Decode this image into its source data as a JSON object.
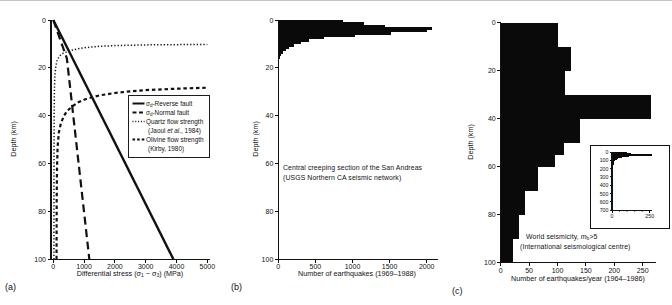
{
  "figure": {
    "bg": "#ffffff",
    "ink": "#111111",
    "bar_fill": "#0a0a0a"
  },
  "panels": {
    "a": {
      "tag": "(a)",
      "ylabel": "Depth (km)",
      "xlabel_parts": {
        "p1": "Differential stress (σ",
        "s1": "1",
        "p2": " − σ",
        "s2": "3",
        "p3": ") (MPa)"
      },
      "legend": [
        {
          "style": "solid",
          "sym": "σ",
          "sym_sub": "d",
          "text": "-Reverse fault",
          "line2": ""
        },
        {
          "style": "long-dash",
          "sym": "σ",
          "sym_sub": "d",
          "text": "-Normal fault",
          "line2": ""
        },
        {
          "style": "dotted",
          "sym": "",
          "sym_sub": "",
          "text": "Quartz flow strength",
          "line2": "(Jaoul *et al*., 1984)"
        },
        {
          "style": "short-dash",
          "sym": "",
          "sym_sub": "",
          "text": "Olivine flow strength",
          "line2": "(Kirby, 1980)"
        }
      ]
    },
    "b": {
      "tag": "(b)",
      "ylabel": "Depth (km)",
      "xlabel": "Number of earthquakes (1969–1988)",
      "annotation": {
        "line1": "Central creeping section of the San Andreas",
        "line2": "(USGS Northern CA seismic network)"
      }
    },
    "c": {
      "tag": "(c)",
      "ylabel": "Depth (km)",
      "xlabel": "Number of earthquakes/year (1964–1986)",
      "annotation": {
        "line1_pre": "World seismicity, ",
        "line1_var": "m",
        "line1_sub": "b",
        "line1_post": ">5",
        "line2": "(International seismological centre)"
      }
    }
  },
  "chart_data": [
    {
      "id": "a",
      "type": "line",
      "panel": "(a)",
      "xlabel": "Differential stress (σ1 − σ3) (MPa)",
      "ylabel": "Depth (km)",
      "xlim": [
        0,
        5000
      ],
      "ylim": [
        0,
        100
      ],
      "y_orientation": "depth-increasing-downward",
      "xticks": [
        0,
        1000,
        2000,
        3000,
        4000,
        5000
      ],
      "yticks": [
        0,
        20,
        40,
        60,
        80,
        100
      ],
      "grid": false,
      "legend_position": "center-right-box",
      "series": [
        {
          "name": "σd-Reverse fault",
          "style": "solid",
          "points": [
            [
              0,
              0
            ],
            [
              3900,
              100
            ]
          ]
        },
        {
          "name": "σd-Normal fault",
          "style": "long-dash",
          "points": [
            [
              0,
              0
            ],
            [
              440,
              16
            ],
            [
              1170,
              100
            ]
          ]
        },
        {
          "name": "Quartz flow strength (Jaoul et al., 1984)",
          "style": "dotted",
          "points": [
            [
              20,
              100
            ],
            [
              21,
              75
            ],
            [
              24,
              55
            ],
            [
              28,
              40
            ],
            [
              35,
              30
            ],
            [
              50,
              23.5
            ],
            [
              80,
              19.5
            ],
            [
              120,
              17
            ],
            [
              200,
              15
            ],
            [
              300,
              14
            ],
            [
              500,
              13
            ],
            [
              700,
              12.3
            ],
            [
              1000,
              11.6
            ],
            [
              1500,
              11
            ],
            [
              2000,
              10.7
            ],
            [
              3000,
              10.4
            ],
            [
              5000,
              10.2
            ]
          ]
        },
        {
          "name": "Olivine flow strength (Kirby, 1980)",
          "style": "short-dash",
          "points": [
            [
              105,
              100
            ],
            [
              110,
              75
            ],
            [
              120,
              62
            ],
            [
              140,
              53
            ],
            [
              180,
              47
            ],
            [
              250,
              43
            ],
            [
              350,
              40
            ],
            [
              450,
              38
            ],
            [
              600,
              36.3
            ],
            [
              800,
              34.5
            ],
            [
              1000,
              33.3
            ],
            [
              1200,
              32.5
            ],
            [
              1500,
              31.5
            ],
            [
              2000,
              30.5
            ],
            [
              2500,
              29.8
            ],
            [
              3000,
              29.3
            ],
            [
              4000,
              28.7
            ],
            [
              5000,
              28.3
            ]
          ]
        }
      ]
    },
    {
      "id": "b",
      "type": "bar",
      "orientation": "horizontal",
      "panel": "(b)",
      "xlabel": "Number of earthquakes (1969–1988)",
      "ylabel": "Depth (km)",
      "xlim": [
        0,
        2150
      ],
      "ylim": [
        0,
        100
      ],
      "xticks": [
        0,
        500,
        1000,
        1500,
        2000
      ],
      "yticks": [
        0,
        20,
        40,
        60,
        80,
        100
      ],
      "grid": false,
      "annotation": "Central creeping section of the San Andreas (USGS Northern CA seismic network)",
      "bars": [
        {
          "depth": [
            0,
            1
          ],
          "value": 870
        },
        {
          "depth": [
            1,
            2
          ],
          "value": 1150
        },
        {
          "depth": [
            2,
            3
          ],
          "value": 1440
        },
        {
          "depth": [
            3,
            4
          ],
          "value": 2070
        },
        {
          "depth": [
            4,
            5
          ],
          "value": 2000
        },
        {
          "depth": [
            5,
            6
          ],
          "value": 1520
        },
        {
          "depth": [
            6,
            7
          ],
          "value": 1030
        },
        {
          "depth": [
            7,
            8
          ],
          "value": 620
        },
        {
          "depth": [
            8,
            9
          ],
          "value": 410
        },
        {
          "depth": [
            9,
            10
          ],
          "value": 300
        },
        {
          "depth": [
            10,
            11
          ],
          "value": 210
        },
        {
          "depth": [
            11,
            12
          ],
          "value": 150
        },
        {
          "depth": [
            12,
            13
          ],
          "value": 100
        },
        {
          "depth": [
            13,
            14
          ],
          "value": 60
        },
        {
          "depth": [
            14,
            15
          ],
          "value": 35
        },
        {
          "depth": [
            15,
            16
          ],
          "value": 20
        },
        {
          "depth": [
            16,
            17
          ],
          "value": 10
        }
      ]
    },
    {
      "id": "c",
      "type": "bar",
      "orientation": "horizontal",
      "panel": "(c)",
      "xlabel": "Number of earthquakes/year (1964–1986)",
      "ylabel": "Depth (km)",
      "xlim": [
        0,
        275
      ],
      "ylim": [
        0,
        100
      ],
      "xticks": [
        0,
        50,
        100,
        150,
        200,
        250
      ],
      "yticks": [
        0,
        20,
        40,
        60,
        80,
        100
      ],
      "grid": false,
      "annotation": "World seismicity, mb>5 (International seismological centre)",
      "bars": [
        {
          "depth": [
            0,
            10
          ],
          "value": 100
        },
        {
          "depth": [
            10,
            20
          ],
          "value": 124
        },
        {
          "depth": [
            20,
            30
          ],
          "value": 114
        },
        {
          "depth": [
            30,
            40
          ],
          "value": 265
        },
        {
          "depth": [
            40,
            50
          ],
          "value": 140
        },
        {
          "depth": [
            50,
            55
          ],
          "value": 111
        },
        {
          "depth": [
            55,
            60
          ],
          "value": 96
        },
        {
          "depth": [
            60,
            70
          ],
          "value": 66
        },
        {
          "depth": [
            70,
            80
          ],
          "value": 42
        },
        {
          "depth": [
            80,
            90
          ],
          "value": 32
        },
        {
          "depth": [
            90,
            100
          ],
          "value": 22
        }
      ],
      "inset": {
        "type": "bar",
        "orientation": "horizontal",
        "xlim": [
          0,
          275
        ],
        "ylim": [
          0,
          700
        ],
        "xticks": [
          0,
          250
        ],
        "xticks_minor": [
          50,
          100,
          150,
          200
        ],
        "yticks": [
          0,
          100,
          200,
          300,
          400,
          500,
          600,
          700
        ],
        "bars": [
          {
            "depth": [
              0,
              10
            ],
            "value": 100
          },
          {
            "depth": [
              10,
              20
            ],
            "value": 124
          },
          {
            "depth": [
              20,
              30
            ],
            "value": 114
          },
          {
            "depth": [
              30,
              40
            ],
            "value": 265
          },
          {
            "depth": [
              40,
              50
            ],
            "value": 140
          },
          {
            "depth": [
              50,
              55
            ],
            "value": 111
          },
          {
            "depth": [
              55,
              60
            ],
            "value": 96
          },
          {
            "depth": [
              60,
              70
            ],
            "value": 66
          },
          {
            "depth": [
              70,
              80
            ],
            "value": 42
          },
          {
            "depth": [
              80,
              90
            ],
            "value": 32
          },
          {
            "depth": [
              90,
              100
            ],
            "value": 22
          },
          {
            "depth": [
              100,
              150
            ],
            "value": 14
          },
          {
            "depth": [
              150,
              200
            ],
            "value": 9
          },
          {
            "depth": [
              200,
              250
            ],
            "value": 6
          },
          {
            "depth": [
              250,
              300
            ],
            "value": 4
          },
          {
            "depth": [
              300,
              350
            ],
            "value": 3
          },
          {
            "depth": [
              350,
              400
            ],
            "value": 2
          },
          {
            "depth": [
              400,
              450
            ],
            "value": 2
          },
          {
            "depth": [
              450,
              500
            ],
            "value": 2
          },
          {
            "depth": [
              500,
              550
            ],
            "value": 2
          },
          {
            "depth": [
              550,
              600
            ],
            "value": 3
          },
          {
            "depth": [
              600,
              650
            ],
            "value": 3
          },
          {
            "depth": [
              650,
              700
            ],
            "value": 1
          }
        ]
      }
    }
  ]
}
